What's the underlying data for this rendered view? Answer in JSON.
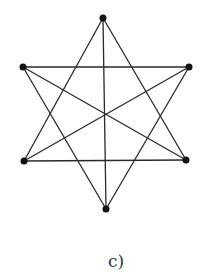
{
  "figure": {
    "label": "c)",
    "colors": {
      "edge": "#2a2a2a",
      "vertex": "#111111",
      "label": "#333333",
      "background": "#ffffff"
    },
    "vertex_radius": 3.5,
    "vertices": [
      {
        "id": "top",
        "x": 103,
        "y": 18
      },
      {
        "id": "upper-left",
        "x": 23,
        "y": 67
      },
      {
        "id": "upper-right",
        "x": 189,
        "y": 67
      },
      {
        "id": "lower-left",
        "x": 24,
        "y": 161
      },
      {
        "id": "lower-right",
        "x": 186,
        "y": 160
      },
      {
        "id": "bottom",
        "x": 106,
        "y": 209
      }
    ],
    "edges": [
      [
        "top",
        "lower-left"
      ],
      [
        "top",
        "lower-right"
      ],
      [
        "lower-left",
        "lower-right"
      ],
      [
        "bottom",
        "upper-left"
      ],
      [
        "bottom",
        "upper-right"
      ],
      [
        "upper-left",
        "upper-right"
      ],
      [
        "top",
        "bottom"
      ],
      [
        "upper-left",
        "lower-right"
      ],
      [
        "upper-right",
        "lower-left"
      ]
    ]
  }
}
